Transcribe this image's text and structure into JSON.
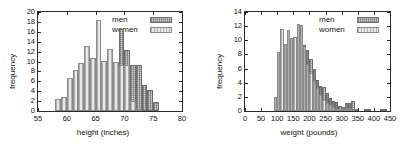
{
  "figure": {
    "background": "#ffffff",
    "colors": {
      "men": "#d2d2d2",
      "women": "#e8e8e8",
      "axis": "#2b2b2b",
      "text": "#111111"
    }
  },
  "chart_data": [
    {
      "type": "bar",
      "title": "",
      "xlabel": "height (inches)",
      "ylabel": "frequency",
      "xlim": [
        55,
        80
      ],
      "ylim": [
        0,
        20
      ],
      "xticks": [
        55,
        60,
        65,
        70,
        75,
        80
      ],
      "yticks": [
        0,
        2,
        4,
        6,
        8,
        10,
        12,
        14,
        16,
        18,
        20
      ],
      "grid": false,
      "legend": {
        "position": "top-right",
        "entries": [
          "men",
          "women"
        ]
      },
      "bin_width": 1,
      "x": [
        58.5,
        59.5,
        60.5,
        61.5,
        62.5,
        63.5,
        64.5,
        65.5,
        66.5,
        67.5,
        68.5,
        69.5,
        70.5,
        71.5,
        72.5,
        73.5,
        74.5,
        75.5
      ],
      "series": [
        {
          "name": "men",
          "values": [
            0,
            0,
            0,
            0,
            0,
            1,
            2,
            2,
            3,
            8,
            9,
            16.5,
            12.3,
            9.2,
            9.2,
            5.3,
            4.2,
            1.9
          ]
        },
        {
          "name": "women",
          "values": [
            2.5,
            2.9,
            6.6,
            8.2,
            9.6,
            13.1,
            10.8,
            18.3,
            10.1,
            12.6,
            9.9,
            9.3,
            9.2,
            2.1,
            0.5,
            0,
            0,
            0
          ]
        }
      ]
    },
    {
      "type": "bar",
      "title": "",
      "xlabel": "weight (pounds)",
      "ylabel": "frequency",
      "xlim": [
        0,
        450
      ],
      "ylim": [
        0,
        14
      ],
      "xticks": [
        0,
        50,
        100,
        150,
        200,
        250,
        300,
        350,
        400,
        450
      ],
      "yticks": [
        0,
        2,
        4,
        6,
        8,
        10,
        12,
        14
      ],
      "grid": false,
      "legend": {
        "position": "top-right",
        "entries": [
          "men",
          "women"
        ]
      },
      "bin_width": 10,
      "x": [
        95,
        105,
        115,
        125,
        135,
        145,
        155,
        165,
        175,
        185,
        195,
        205,
        215,
        225,
        235,
        245,
        255,
        265,
        275,
        285,
        295,
        305,
        315,
        325,
        335,
        345,
        375,
        385,
        425,
        435
      ],
      "series": [
        {
          "name": "men",
          "values": [
            0,
            0,
            0.6,
            1.0,
            1.6,
            2.2,
            3.4,
            6.4,
            7.9,
            9.3,
            8.6,
            7.3,
            5.9,
            4.4,
            3.6,
            3.4,
            2.6,
            1.9,
            1.4,
            1.3,
            0.7,
            0.5,
            1.1,
            1.2,
            1.4,
            0.2,
            0.2,
            0.2,
            0.1,
            0.1
          ]
        },
        {
          "name": "women",
          "values": [
            2.0,
            8.4,
            11.6,
            9.5,
            11.5,
            10.3,
            10.4,
            12.3,
            12.1,
            9.2,
            6.6,
            5.4,
            4.3,
            3.2,
            2.3,
            1.6,
            1.1,
            0.8,
            0.5,
            0.3,
            0.2,
            0.2,
            0.1,
            0.1,
            0.1,
            0,
            0,
            0,
            0,
            0
          ]
        }
      ]
    }
  ]
}
